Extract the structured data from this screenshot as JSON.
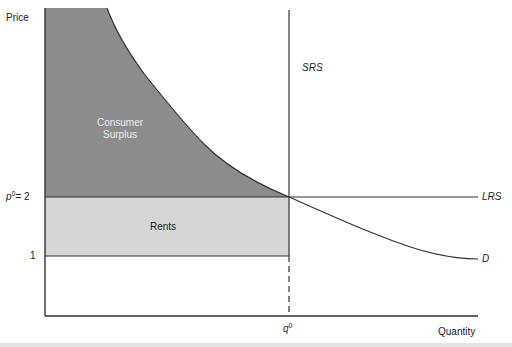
{
  "diagram": {
    "y_axis_label": "Price",
    "x_axis_label": "Quantity",
    "price_label_p0_base": "p",
    "price_label_p0_sup": "0",
    "price_label_p0_eq": "= 2",
    "price_label_1": "1",
    "quantity_label_base": "q",
    "quantity_label_sup": "0",
    "srs_label": "SRS",
    "lrs_label": "LRS",
    "demand_label": "D",
    "consumer_surplus_line1": "Consumer",
    "consumer_surplus_line2": "Surplus",
    "rents_label": "Rents",
    "colors": {
      "consumer_surplus_fill": "#8c8c8c",
      "rents_fill": "#d6d6d6",
      "lines": "#333333"
    }
  }
}
